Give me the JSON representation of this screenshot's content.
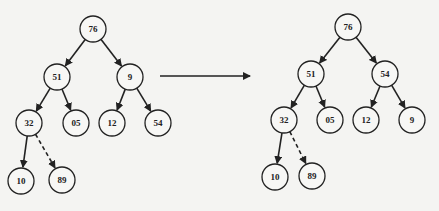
{
  "diagram": {
    "type": "binary-tree-transformation",
    "style": {
      "stroke": "#222222",
      "node_fill": "#f7f7f5",
      "background": "#f4f4f2",
      "node_radius": 13
    },
    "trees": [
      {
        "id": "before",
        "nodes": [
          {
            "id": "b76",
            "label": "76",
            "x": 93,
            "y": 29
          },
          {
            "id": "b51",
            "label": "51",
            "x": 57,
            "y": 77
          },
          {
            "id": "b9",
            "label": "9",
            "x": 130,
            "y": 77
          },
          {
            "id": "b32",
            "label": "32",
            "x": 29,
            "y": 123
          },
          {
            "id": "b05",
            "label": "05",
            "x": 76,
            "y": 123
          },
          {
            "id": "b12",
            "label": "12",
            "x": 112,
            "y": 123
          },
          {
            "id": "b54",
            "label": "54",
            "x": 158,
            "y": 123
          },
          {
            "id": "b10",
            "label": "10",
            "x": 21,
            "y": 181
          },
          {
            "id": "b89",
            "label": "89",
            "x": 62,
            "y": 180
          }
        ],
        "edges": [
          {
            "from": "b76",
            "to": "b51",
            "style": "solid"
          },
          {
            "from": "b76",
            "to": "b9",
            "style": "solid"
          },
          {
            "from": "b51",
            "to": "b32",
            "style": "solid"
          },
          {
            "from": "b51",
            "to": "b05",
            "style": "solid"
          },
          {
            "from": "b9",
            "to": "b12",
            "style": "solid"
          },
          {
            "from": "b9",
            "to": "b54",
            "style": "solid"
          },
          {
            "from": "b32",
            "to": "b10",
            "style": "solid"
          },
          {
            "from": "b32",
            "to": "b89",
            "style": "dashed"
          }
        ]
      },
      {
        "id": "after",
        "nodes": [
          {
            "id": "a76",
            "label": "76",
            "x": 348,
            "y": 27
          },
          {
            "id": "a51",
            "label": "51",
            "x": 311,
            "y": 74
          },
          {
            "id": "a54",
            "label": "54",
            "x": 385,
            "y": 74
          },
          {
            "id": "a32",
            "label": "32",
            "x": 284,
            "y": 120
          },
          {
            "id": "a05",
            "label": "05",
            "x": 330,
            "y": 120
          },
          {
            "id": "a12",
            "label": "12",
            "x": 366,
            "y": 120
          },
          {
            "id": "a9",
            "label": "9",
            "x": 412,
            "y": 120
          },
          {
            "id": "a10",
            "label": "10",
            "x": 275,
            "y": 177
          },
          {
            "id": "a89",
            "label": "89",
            "x": 312,
            "y": 176
          }
        ],
        "edges": [
          {
            "from": "a76",
            "to": "a51",
            "style": "solid"
          },
          {
            "from": "a76",
            "to": "a54",
            "style": "solid"
          },
          {
            "from": "a51",
            "to": "a32",
            "style": "solid"
          },
          {
            "from": "a51",
            "to": "a05",
            "style": "solid"
          },
          {
            "from": "a54",
            "to": "a12",
            "style": "solid"
          },
          {
            "from": "a54",
            "to": "a9",
            "style": "solid"
          },
          {
            "from": "a32",
            "to": "a10",
            "style": "solid"
          },
          {
            "from": "a32",
            "to": "a89",
            "style": "dashed"
          }
        ]
      }
    ],
    "transition_arrow": {
      "x1": 160,
      "y1": 76,
      "x2": 250,
      "y2": 76
    }
  }
}
